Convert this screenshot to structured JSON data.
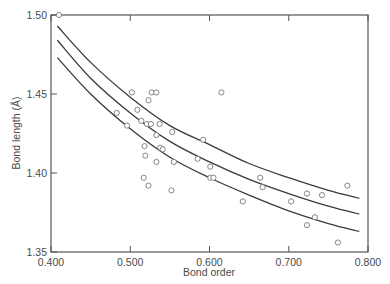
{
  "chart_data": {
    "type": "scatter",
    "title": "",
    "xlabel": "Bond order",
    "ylabel": "Bond length (Å)",
    "xlim": [
      0.4,
      0.8
    ],
    "ylim": [
      1.35,
      1.5
    ],
    "xticks": [
      "0.400",
      "0.500",
      "0.600",
      "0.700",
      "0.800"
    ],
    "xtick_values": [
      0.4,
      0.5,
      0.6,
      0.7,
      0.8
    ],
    "yticks": [
      "1.35",
      "1.40",
      "1.45",
      "1.50"
    ],
    "ytick_values": [
      1.35,
      1.4,
      1.45,
      1.5
    ],
    "grid": false,
    "legend": null,
    "series": [
      {
        "name": "observed",
        "marker": "open-circle",
        "points": [
          [
            0.41,
            1.5
          ],
          [
            0.502,
            1.451
          ],
          [
            0.527,
            1.451
          ],
          [
            0.533,
            1.451
          ],
          [
            0.615,
            1.451
          ],
          [
            0.523,
            1.446
          ],
          [
            0.509,
            1.44
          ],
          [
            0.483,
            1.438
          ],
          [
            0.496,
            1.43
          ],
          [
            0.514,
            1.433
          ],
          [
            0.521,
            1.431
          ],
          [
            0.526,
            1.431
          ],
          [
            0.537,
            1.431
          ],
          [
            0.553,
            1.426
          ],
          [
            0.533,
            1.424
          ],
          [
            0.592,
            1.421
          ],
          [
            0.518,
            1.417
          ],
          [
            0.538,
            1.416
          ],
          [
            0.541,
            1.415
          ],
          [
            0.519,
            1.411
          ],
          [
            0.533,
            1.407
          ],
          [
            0.555,
            1.407
          ],
          [
            0.585,
            1.409
          ],
          [
            0.601,
            1.404
          ],
          [
            0.601,
            1.397
          ],
          [
            0.605,
            1.397
          ],
          [
            0.517,
            1.397
          ],
          [
            0.523,
            1.392
          ],
          [
            0.552,
            1.389
          ],
          [
            0.664,
            1.397
          ],
          [
            0.667,
            1.391
          ],
          [
            0.642,
            1.382
          ],
          [
            0.774,
            1.392
          ],
          [
            0.723,
            1.387
          ],
          [
            0.742,
            1.386
          ],
          [
            0.703,
            1.382
          ],
          [
            0.733,
            1.372
          ],
          [
            0.723,
            1.367
          ],
          [
            0.762,
            1.356
          ]
        ]
      }
    ],
    "curves": [
      {
        "name": "upper-curve",
        "points": [
          [
            0.408,
            1.493
          ],
          [
            0.45,
            1.47
          ],
          [
            0.5,
            1.448
          ],
          [
            0.55,
            1.43
          ],
          [
            0.6,
            1.418
          ],
          [
            0.65,
            1.406
          ],
          [
            0.7,
            1.397
          ],
          [
            0.75,
            1.389
          ],
          [
            0.789,
            1.384
          ]
        ]
      },
      {
        "name": "middle-curve",
        "points": [
          [
            0.408,
            1.484
          ],
          [
            0.45,
            1.46
          ],
          [
            0.5,
            1.438
          ],
          [
            0.55,
            1.42
          ],
          [
            0.6,
            1.407
          ],
          [
            0.65,
            1.396
          ],
          [
            0.7,
            1.387
          ],
          [
            0.75,
            1.379
          ],
          [
            0.789,
            1.374
          ]
        ]
      },
      {
        "name": "lower-curve",
        "points": [
          [
            0.408,
            1.473
          ],
          [
            0.45,
            1.45
          ],
          [
            0.5,
            1.428
          ],
          [
            0.55,
            1.41
          ],
          [
            0.6,
            1.397
          ],
          [
            0.65,
            1.386
          ],
          [
            0.7,
            1.376
          ],
          [
            0.75,
            1.368
          ],
          [
            0.789,
            1.363
          ]
        ]
      }
    ]
  },
  "colors": {
    "axis": "#555555",
    "curve": "#3a3a3a",
    "marker": "#777777",
    "text": "#4a4a4a"
  }
}
